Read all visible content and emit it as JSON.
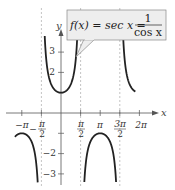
{
  "chart_data": {
    "type": "line",
    "function": "sec x",
    "xlabel": "x",
    "ylabel": "y",
    "xlim": [
      -3.8,
      7.0
    ],
    "ylim": [
      -3.5,
      4.0
    ],
    "x_ticks": [
      {
        "value": -3.14159,
        "label": "−π"
      },
      {
        "value": -1.5708,
        "label": "−π/2"
      },
      {
        "value": 1.5708,
        "label": "π/2"
      },
      {
        "value": 3.14159,
        "label": "π"
      },
      {
        "value": 4.71239,
        "label": "3π/2"
      },
      {
        "value": 6.28319,
        "label": "2π"
      }
    ],
    "y_ticks": [
      {
        "value": 3,
        "label": "3"
      },
      {
        "value": 2,
        "label": "2"
      },
      {
        "value": 1,
        "label": ""
      },
      {
        "value": -1,
        "label": ""
      },
      {
        "value": -2,
        "label": "−2"
      },
      {
        "value": -3,
        "label": "−3"
      }
    ],
    "asymptotes": [
      -1.5708,
      1.5708,
      4.71239
    ],
    "grid": false,
    "legend": null,
    "annotation": {
      "lhs": "f(x) = sec x =",
      "numerator": "1",
      "denominator": "cos x"
    }
  },
  "labels": {
    "x_axis": "x",
    "y_axis": "y",
    "x_ticks": [
      "−π",
      "π/2",
      "π",
      "3π/2",
      "2π"
    ],
    "neg_half_pi_num": "π",
    "neg_half_pi_den": "2",
    "half_pi_num": "π",
    "half_pi_den": "2",
    "three_half_pi_num": "3π",
    "three_half_pi_den": "2",
    "neg_pi": "−π",
    "pi": "π",
    "two_pi": "2π",
    "y3": "3",
    "y2": "2",
    "yneg2": "−2",
    "yneg3": "−3",
    "minus_sign": "−"
  },
  "callout": {
    "lhs": "f(x) = sec x =",
    "numerator": "1",
    "denominator": "cos x"
  },
  "colors": {
    "curve": "#222222",
    "axis": "#555555",
    "asymptote": "#aaaaaa",
    "callout_bg": "#eeeeee",
    "callout_border": "#888888"
  }
}
